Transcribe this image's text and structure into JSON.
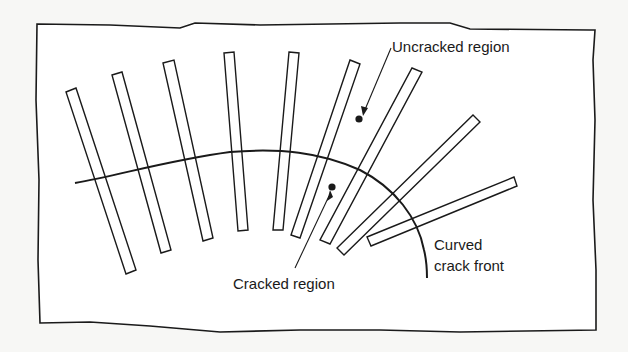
{
  "diagram": {
    "type": "schematic",
    "colors": {
      "background": "#f7f7f5",
      "panel": "#ffffff",
      "ink": "#1a1a1a"
    },
    "labels": {
      "uncracked": "Uncracked region",
      "cracked": "Cracked region",
      "front_line1": "Curved",
      "front_line2": "crack front"
    },
    "strip_count": 9
  }
}
